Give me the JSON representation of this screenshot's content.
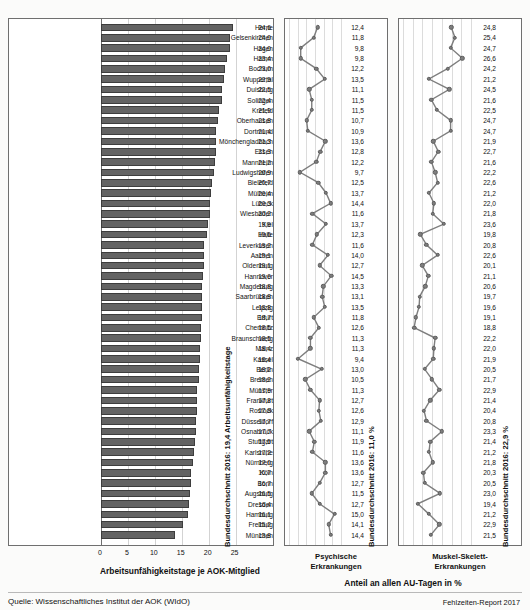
{
  "chart_data": {
    "type": "bar",
    "title": "",
    "categories": [
      "Herne",
      "Gelsenkirchen",
      "Hagen",
      "Hamm",
      "Bochum",
      "Wuppertal",
      "Duisburg",
      "Solingen",
      "Krefeld",
      "Oberhausen",
      "Dortmund",
      "Mönchengladbach",
      "Essen",
      "Mannheim",
      "Ludwigshafen",
      "Bielefeld",
      "Mülheim",
      "Lübeck",
      "Wiesbaden",
      "Kiel",
      "Halle",
      "Leverkusen",
      "Aachen",
      "Oldenburg",
      "Hannover",
      "Magdeburg",
      "Saarbrücken",
      "Leipzig",
      "Erfurt",
      "Chemnitz",
      "Braunschweig",
      "Mainz",
      "Kassel",
      "Berlin",
      "Bremen",
      "Münster",
      "Frankfurt",
      "Rostock",
      "Düsseldorf",
      "Osnabrück",
      "Stuttgart",
      "Karlsruhe",
      "Nürnberg",
      "Köln",
      "Bonn",
      "Augsburg",
      "Dresden",
      "Hamburg",
      "Freiburg",
      "München"
    ],
    "xlabel": "Arbeitsunfähigkeitstage je AOK-Mitglied",
    "ylabel": "",
    "xlim": [
      0,
      26
    ],
    "xticks": [
      0,
      5,
      10,
      15,
      20,
      25
    ],
    "grid": true,
    "legend": "none",
    "series": [
      {
        "name": "Arbeitsunfähigkeitstage je AOK-Mitglied",
        "type": "bar",
        "values": [
          24.6,
          24.0,
          24.0,
          23.4,
          23.0,
          22.9,
          22.5,
          22.4,
          21.9,
          21.8,
          21.4,
          21.3,
          21.3,
          21.2,
          20.9,
          20.7,
          20.4,
          20.3,
          20.2,
          19.9,
          19.6,
          19.2,
          19.1,
          19.1,
          19.0,
          18.8,
          18.8,
          18.8,
          18.7,
          18.5,
          18.5,
          18.4,
          18.4,
          18.2,
          18.2,
          17.9,
          17.8,
          17.8,
          17.7,
          17.7,
          17.5,
          17.2,
          17.0,
          16.7,
          16.7,
          16.5,
          16.4,
          16.1,
          15.2,
          13.8
        ],
        "average_label": "Bundesdurchschnitt 2016: 19,4 Arbeitsunfähigkeitstage",
        "average": 19.4
      },
      {
        "name": "Psychische Erkrankungen",
        "type": "line",
        "values": [
          12.4,
          11.8,
          9.8,
          9.8,
          12.2,
          13.5,
          11.1,
          11.5,
          11.5,
          10.7,
          10.9,
          13.6,
          12.8,
          12.2,
          9.7,
          12.5,
          13.7,
          14.4,
          11.6,
          13.7,
          12.3,
          11.6,
          14.0,
          12.7,
          14.5,
          13.3,
          13.1,
          13.5,
          11.8,
          12.6,
          11.3,
          11.3,
          9.4,
          13.0,
          10.5,
          11.3,
          12.7,
          12.6,
          12.9,
          11.1,
          11.9,
          11.6,
          13.6,
          13.6,
          12.7,
          11.5,
          12.7,
          15.0,
          14.1,
          14.4
        ],
        "average_label": "Bundesdurchschnitt 2016: 11,0 %",
        "average": 11.0,
        "xlim": [
          8,
          16
        ]
      },
      {
        "name": "Muskel-Skelett-Erkrankungen",
        "type": "line",
        "values": [
          24.8,
          25.4,
          24.7,
          26.6,
          24.2,
          21.2,
          24.5,
          21.6,
          22.5,
          24.7,
          24.7,
          21.9,
          22.7,
          21.6,
          22.2,
          22.6,
          21.2,
          22.0,
          21.8,
          23.6,
          19.8,
          20.8,
          22.6,
          20.1,
          21.1,
          20.6,
          19.7,
          19.6,
          19.1,
          18.8,
          22.2,
          22.0,
          21.9,
          20.5,
          21.7,
          22.9,
          21.4,
          20.4,
          20.8,
          23.3,
          21.4,
          21.2,
          21.8,
          20.3,
          20.5,
          23.0,
          19.4,
          21.2,
          22.9,
          21.5
        ],
        "average_label": "Bundesdurchschnitt 2016: 22,9 %",
        "average": 22.9,
        "xlim": [
          17,
          28
        ]
      }
    ]
  },
  "panels": {
    "bars": {
      "axis_title": "Arbeitsunfähigkeitstage je AOK-Mitglied",
      "ticks": [
        "0",
        "5",
        "10",
        "15",
        "20",
        "25"
      ],
      "average_caption": "Bundesdurchschnitt 2016: 19,4 Arbeitsunfähigkeitstage"
    },
    "middle": {
      "caption_line1": "Psychische",
      "caption_line2": "Erkrankungen",
      "average_caption": "Bundesdurchschnitt 2016: 11,0 %"
    },
    "right": {
      "caption_line1": "Muskel-Skelett-",
      "caption_line2": "Erkrankungen",
      "average_caption": "Bundesdurchschnitt 2016: 22,9 %"
    },
    "shared_axis_title": "Anteil an allen AU-Tagen in %"
  },
  "footer": {
    "source": "Quelle: Wissenschaftliches Institut der AOK (WIdO)",
    "report": "Fehlzeiten-Report 2017"
  },
  "colors": {
    "bar_fill": "#636363",
    "dot_fill": "#7e7e7e",
    "grid": "#d3d3d3",
    "frame": "#6f6f6f",
    "background": "#fbfbfa"
  }
}
